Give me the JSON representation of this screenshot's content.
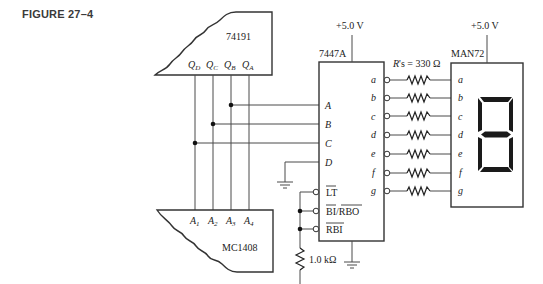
{
  "figure": {
    "title": "FIGURE 27–4"
  },
  "chips": {
    "counter": {
      "name": "74191",
      "outputs": [
        "Q_D",
        "Q_C",
        "Q_B",
        "Q_A"
      ]
    },
    "decoder": {
      "name": "7447A",
      "supply": "+5.0 V",
      "inputs": [
        "A",
        "B",
        "C",
        "D"
      ],
      "control_pins": [
        "LT",
        "BI/RBO",
        "RBI"
      ],
      "outputs": [
        "a",
        "b",
        "c",
        "d",
        "e",
        "f",
        "g"
      ]
    },
    "display": {
      "name": "MAN72",
      "supply": "+5.0 V",
      "inputs": [
        "a",
        "b",
        "c",
        "d",
        "e",
        "f",
        "g"
      ],
      "digit_shown": "8-segment outline"
    },
    "dac": {
      "name": "MC1408",
      "inputs": [
        "A_1",
        "A_2",
        "A_3",
        "A_4"
      ]
    }
  },
  "components": {
    "segment_resistors": {
      "label": "R's = 330 Ω",
      "count": 7
    },
    "pullup_resistor": {
      "label": "1.0 kΩ"
    }
  },
  "labels": {
    "qd": "Q",
    "qd_sub": "D",
    "qc": "Q",
    "qc_sub": "C",
    "qb": "Q",
    "qb_sub": "B",
    "qa": "Q",
    "qa_sub": "A",
    "a1": "A",
    "a1_sub": "1",
    "a2": "A",
    "a2_sub": "2",
    "a3": "A",
    "a3_sub": "3",
    "a4": "A",
    "a4_sub": "4",
    "in_a": "A",
    "in_b": "B",
    "in_c": "C",
    "in_d": "D",
    "lt": "LT",
    "bi_rbo": "BI/RBO",
    "rbi": "RBI",
    "out": [
      "a",
      "b",
      "c",
      "d",
      "e",
      "f",
      "g"
    ],
    "res_label": "R's = 330 Ω",
    "pullup_label": "1.0 kΩ",
    "supply": "+5.0 V",
    "counter_name": "74191",
    "decoder_name": "7447A",
    "display_name": "MAN72",
    "dac_name": "MC1408"
  }
}
